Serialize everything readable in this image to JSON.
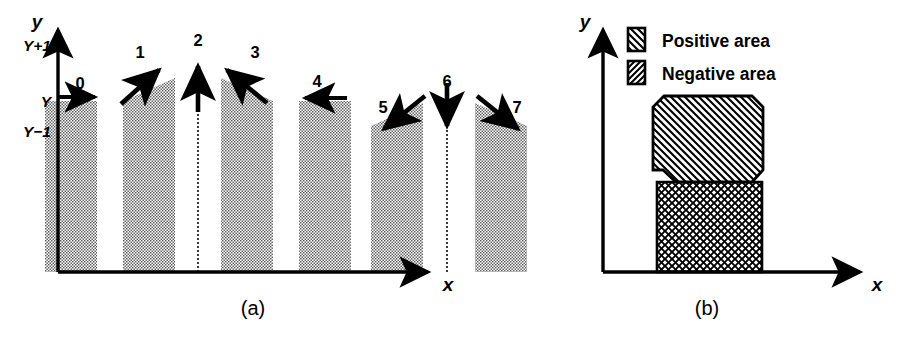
{
  "figure": {
    "background": "#ffffff",
    "ink": "#000000",
    "panels": [
      {
        "id": "a",
        "caption": "(a)",
        "axes": {
          "y_label": "y",
          "x_label": "x",
          "y_ticks": [
            "Y+1",
            "Y",
            "Y−1"
          ]
        },
        "bars": [
          {
            "index": "0",
            "label": "0",
            "arrow_direction": "east",
            "arrow_degrees": 0,
            "top_kind": "flat",
            "has_bar": true
          },
          {
            "index": "1",
            "label": "1",
            "arrow_direction": "northeast",
            "arrow_degrees": 45,
            "top_kind": "slope-up",
            "has_bar": true
          },
          {
            "index": "2",
            "label": "2",
            "arrow_direction": "north",
            "arrow_degrees": 90,
            "top_kind": "dotted-line",
            "has_bar": false
          },
          {
            "index": "3",
            "label": "3",
            "arrow_direction": "northwest",
            "arrow_degrees": 135,
            "top_kind": "slope-down",
            "has_bar": true
          },
          {
            "index": "4",
            "label": "4",
            "arrow_direction": "west",
            "arrow_degrees": 180,
            "top_kind": "flat",
            "has_bar": true
          },
          {
            "index": "5",
            "label": "5",
            "arrow_direction": "southwest",
            "arrow_degrees": 225,
            "top_kind": "slope-up",
            "has_bar": true
          },
          {
            "index": "6",
            "label": "6",
            "arrow_direction": "south",
            "arrow_degrees": 270,
            "top_kind": "dotted-line",
            "has_bar": false
          },
          {
            "index": "7",
            "label": "7",
            "arrow_direction": "southeast",
            "arrow_degrees": 315,
            "top_kind": "slope-down",
            "has_bar": true
          }
        ]
      },
      {
        "id": "b",
        "caption": "(b)",
        "axes": {
          "y_label": "y",
          "x_label": "x"
        },
        "legend": [
          {
            "key": "positive",
            "label": "Positive area",
            "hatch": "backslash"
          },
          {
            "key": "negative",
            "label": "Negative area",
            "hatch": "forwardslash-cross"
          }
        ],
        "regions": [
          {
            "key": "positive",
            "shape": "octagon-with-notch",
            "hatch": "backslash"
          },
          {
            "key": "negative",
            "shape": "rectangle",
            "hatch": "cross"
          }
        ]
      }
    ]
  }
}
